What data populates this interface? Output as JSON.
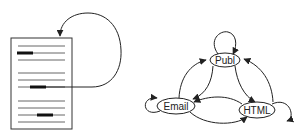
{
  "diagram": {
    "document": {
      "x": 11,
      "y": 38,
      "width": 61,
      "height": 91,
      "lines_y": [
        46,
        53,
        60,
        73,
        80,
        87,
        101,
        108,
        115,
        122
      ],
      "line_x1": 18,
      "line_x2": 65,
      "highlights": [
        {
          "y": 53,
          "x1": 17,
          "x2": 33
        },
        {
          "y": 87,
          "x1": 30,
          "x2": 46
        },
        {
          "y": 115,
          "x1": 37,
          "x2": 53
        }
      ]
    },
    "nodes": [
      {
        "id": "publ",
        "label": "Publ",
        "cx": 225,
        "cy": 60,
        "rx": 15,
        "ry": 7
      },
      {
        "id": "email",
        "label": "Email",
        "cx": 176,
        "cy": 106,
        "rx": 19,
        "ry": 8
      },
      {
        "id": "html",
        "label": "HTML",
        "cx": 257,
        "cy": 110,
        "rx": 18,
        "ry": 8
      }
    ],
    "edges": [
      {
        "from": "document",
        "to": "document",
        "type": "link-loop"
      },
      {
        "from": "publ",
        "to": "publ",
        "type": "self-loop"
      },
      {
        "from": "email",
        "to": "email",
        "type": "self-loop"
      },
      {
        "from": "html",
        "to": "html",
        "type": "self-loop"
      },
      {
        "from": "email",
        "to": "publ"
      },
      {
        "from": "publ",
        "to": "email"
      },
      {
        "from": "publ",
        "to": "html"
      },
      {
        "from": "html",
        "to": "publ"
      },
      {
        "from": "email",
        "to": "html"
      },
      {
        "from": "html",
        "to": "email"
      }
    ],
    "colors": {
      "stroke": "#222222",
      "doc_lines": "#555555",
      "highlight": "#111111",
      "background": "#ffffff"
    }
  }
}
